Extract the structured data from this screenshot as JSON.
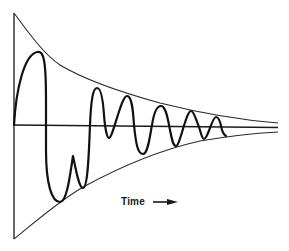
{
  "figure": {
    "x_axis_label": "Time",
    "arrow_direction": "right",
    "colors": {
      "background": "#ffffff",
      "line": "#111111"
    }
  }
}
